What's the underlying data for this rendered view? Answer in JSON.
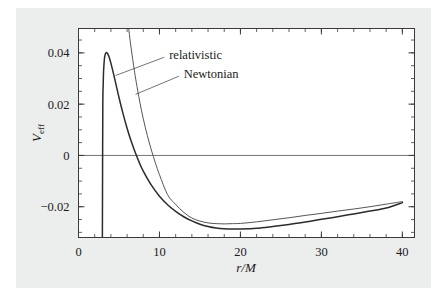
{
  "figure": {
    "background_color": "#eceded",
    "page_color": "#ffffff",
    "frame_color": "#3a3a3a"
  },
  "chart_data": {
    "type": "line",
    "title": "",
    "subtitle": "",
    "xlabel": "r/M",
    "ylabel": "V_eff",
    "ylabel_base": "V",
    "ylabel_sub": "eff",
    "xlim": [
      0,
      41.5
    ],
    "ylim": [
      -0.032,
      0.0495
    ],
    "grid": false,
    "zero_line": true,
    "legend_position": "inline-annotations",
    "x_ticks_major": [
      0,
      10,
      20,
      30,
      40
    ],
    "x_ticks_major_labels": [
      "0",
      "10",
      "20",
      "30",
      "40"
    ],
    "x_tick_minor_step": 2,
    "y_ticks_major": [
      -0.02,
      0,
      0.02,
      0.04
    ],
    "y_ticks_major_labels": [
      "−0.02",
      "0",
      "0.02",
      "0.04"
    ],
    "y_tick_minor_step": 0.005,
    "annotations": [
      {
        "label": "relativistic",
        "text_x": 11.2,
        "text_y": 0.0392,
        "leader_from_x": 10.6,
        "leader_from_y": 0.0383,
        "leader_to_x": 4.6,
        "leader_to_y": 0.0312
      },
      {
        "label": "Newtonian",
        "text_x": 13.0,
        "text_y": 0.0318,
        "leader_from_x": 12.4,
        "leader_from_y": 0.0309,
        "leader_to_x": 7.05,
        "leader_to_y": 0.0238
      }
    ],
    "series": [
      {
        "name": "relativistic",
        "style": "solid",
        "color": "#2b2b2b",
        "width": 1.5,
        "formula": "-1/r + L^2/(2 r^2) - L^2/r^3",
        "L_over_M": 4.3,
        "peak": {
          "x": 3.5,
          "y": 0.0401
        },
        "minimum": {
          "x": 15.0,
          "y": -0.0286
        },
        "endpoint": {
          "x": 40,
          "y": -0.0184
        },
        "points": [
          [
            2.95,
            -0.032
          ],
          [
            3.0,
            0.018
          ],
          [
            3.05,
            0.0275
          ],
          [
            3.1,
            0.033
          ],
          [
            3.2,
            0.0376
          ],
          [
            3.3,
            0.0394
          ],
          [
            3.4,
            0.04
          ],
          [
            3.5,
            0.0401
          ],
          [
            3.6,
            0.0397
          ],
          [
            3.8,
            0.0382
          ],
          [
            4.0,
            0.036
          ],
          [
            4.3,
            0.0322
          ],
          [
            4.6,
            0.0281
          ],
          [
            5.0,
            0.0226
          ],
          [
            5.5,
            0.0163
          ],
          [
            6.0,
            0.0106
          ],
          [
            6.5,
            0.0056
          ],
          [
            7.0,
            0.0012
          ],
          [
            7.5,
            -0.0027
          ],
          [
            8.0,
            -0.0061
          ],
          [
            9.0,
            -0.0116
          ],
          [
            10.0,
            -0.0159
          ],
          [
            11.0,
            -0.0192
          ],
          [
            12.0,
            -0.0218
          ],
          [
            13.0,
            -0.0239
          ],
          [
            14.0,
            -0.0255
          ],
          [
            15.0,
            -0.0268
          ],
          [
            16.0,
            -0.0277
          ],
          [
            17.0,
            -0.0283
          ],
          [
            18.0,
            -0.0286
          ],
          [
            19.0,
            -0.0287
          ],
          [
            20.0,
            -0.0287
          ],
          [
            22.0,
            -0.0284
          ],
          [
            24.0,
            -0.0277
          ],
          [
            26.0,
            -0.0269
          ],
          [
            28.0,
            -0.026
          ],
          [
            30.0,
            -0.0249
          ],
          [
            32.0,
            -0.0239
          ],
          [
            34.0,
            -0.0228
          ],
          [
            36.0,
            -0.0217
          ],
          [
            38.0,
            -0.0205
          ],
          [
            40.0,
            -0.0184
          ]
        ]
      },
      {
        "name": "Newtonian",
        "style": "solid",
        "color": "#555555",
        "width": 1.0,
        "formula": "-1/r + L^2/(2 r^2)",
        "L_over_M": 4.3,
        "minimum": {
          "x": 18.5,
          "y": -0.0265
        },
        "endpoint": {
          "x": 40,
          "y": -0.018
        },
        "points": [
          [
            6.2,
            0.0495
          ],
          [
            6.4,
            0.0443
          ],
          [
            6.6,
            0.0396
          ],
          [
            6.8,
            0.0352
          ],
          [
            7.0,
            0.0311
          ],
          [
            7.3,
            0.0255
          ],
          [
            7.6,
            0.0204
          ],
          [
            8.0,
            0.0143
          ],
          [
            8.5,
            0.0078
          ],
          [
            9.0,
            0.0021
          ],
          [
            9.5,
            -0.0029
          ],
          [
            10.0,
            -0.0075
          ],
          [
            11.0,
            -0.0153
          ],
          [
            12.0,
            -0.0191
          ],
          [
            13.0,
            -0.0222
          ],
          [
            14.0,
            -0.0244
          ],
          [
            15.0,
            -0.0256
          ],
          [
            16.0,
            -0.0263
          ],
          [
            17.0,
            -0.0266
          ],
          [
            18.0,
            -0.0267
          ],
          [
            19.0,
            -0.0266
          ],
          [
            20.0,
            -0.0265
          ],
          [
            22.0,
            -0.0259
          ],
          [
            24.0,
            -0.0251
          ],
          [
            26.0,
            -0.0243
          ],
          [
            28.0,
            -0.0234
          ],
          [
            30.0,
            -0.0226
          ],
          [
            32.0,
            -0.0217
          ],
          [
            34.0,
            -0.0209
          ],
          [
            36.0,
            -0.02
          ],
          [
            38.0,
            -0.019
          ],
          [
            40.0,
            -0.018
          ]
        ]
      }
    ]
  }
}
